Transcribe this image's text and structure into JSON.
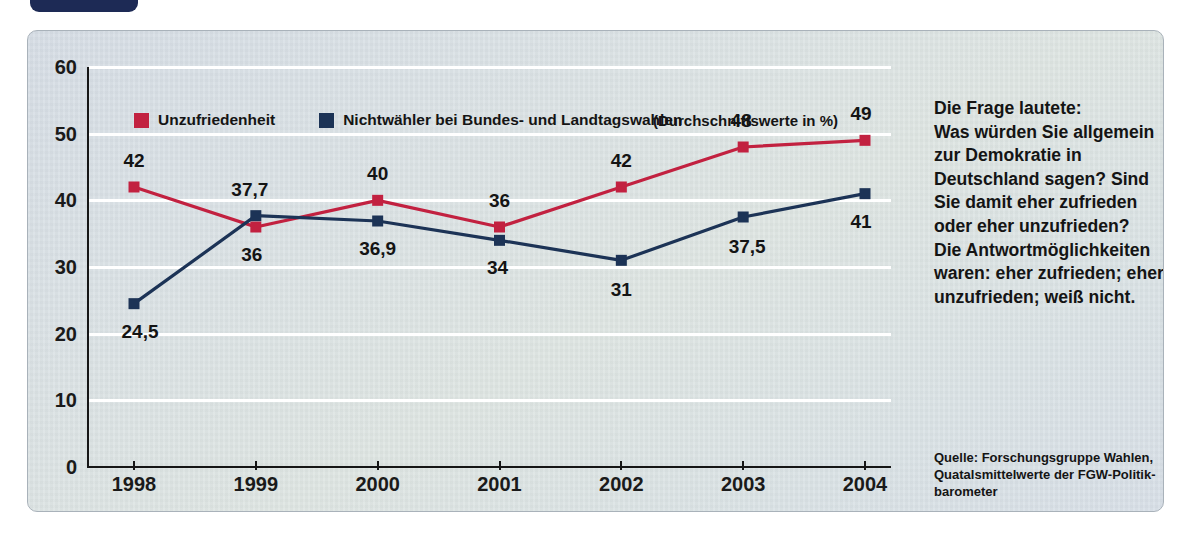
{
  "header": {
    "badge_label": "",
    "title": "Nichtwähler und..."
  },
  "legend": {
    "series": [
      {
        "label": "Unzufriedenheit",
        "color": "#c22140"
      },
      {
        "label": "Nichtwähler bei Bundes- und Landtagswahlen",
        "color": "#1c3356"
      }
    ],
    "note": "(Durchschnittswerte in %)"
  },
  "sidebar": {
    "question_lines": [
      "Die Frage lautete:",
      "Was würden Sie allgemein",
      "zur Demokratie in",
      "Deutschland sagen? Sind",
      "Sie damit eher zufrieden",
      "oder eher unzufrieden?",
      "Die Antwortmöglichkeiten",
      "waren: eher zufrieden; eher",
      "unzufrieden; weiß nicht."
    ],
    "source_lines": [
      "Quelle: Forschungsgruppe Wahlen,",
      "Quatalsmittelwerte der FGW-Politik-",
      "barometer"
    ]
  },
  "chart_data": {
    "type": "line",
    "title": "",
    "xlabel": "",
    "ylabel": "",
    "categories": [
      "1998",
      "1999",
      "2000",
      "2001",
      "2002",
      "2003",
      "2004"
    ],
    "ylim": [
      0,
      60
    ],
    "yticks": [
      0,
      10,
      20,
      30,
      40,
      50,
      60
    ],
    "ytick_labels": [
      "0",
      "10",
      "20",
      "30",
      "40",
      "50",
      "60"
    ],
    "grid": true,
    "legend_position": "top-left",
    "series": [
      {
        "name": "Unzufriedenheit",
        "color": "#c22140",
        "values": [
          42,
          36,
          40,
          36,
          42,
          48,
          49
        ],
        "value_labels": [
          "42",
          "36",
          "40",
          "36",
          "42",
          "48",
          "49"
        ],
        "label_offsets": [
          {
            "dx": 0,
            "dy": -26
          },
          {
            "dx": -4,
            "dy": 28
          },
          {
            "dx": 0,
            "dy": -26
          },
          {
            "dx": 0,
            "dy": -26
          },
          {
            "dx": 0,
            "dy": -26
          },
          {
            "dx": -2,
            "dy": -26
          },
          {
            "dx": -4,
            "dy": -26
          }
        ]
      },
      {
        "name": "Nichtwähler bei Bundes- und Landtagswahlen",
        "color": "#1c3356",
        "values": [
          24.5,
          37.7,
          36.9,
          34,
          31,
          37.5,
          41
        ],
        "value_labels": [
          "24,5",
          "37,7",
          "36,9",
          "34",
          "31",
          "37,5",
          "41"
        ],
        "label_offsets": [
          {
            "dx": 6,
            "dy": 28
          },
          {
            "dx": -6,
            "dy": -26
          },
          {
            "dx": 0,
            "dy": 28
          },
          {
            "dx": -2,
            "dy": 28
          },
          {
            "dx": 0,
            "dy": 30
          },
          {
            "dx": 4,
            "dy": 30
          },
          {
            "dx": -4,
            "dy": 28
          }
        ]
      }
    ]
  }
}
